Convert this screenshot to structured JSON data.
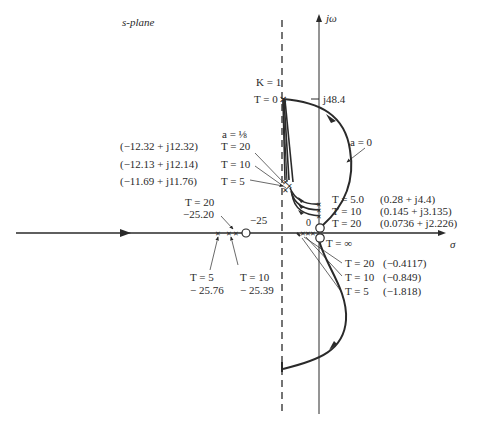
{
  "title": "s-plane",
  "axes": {
    "imag_label": "jω",
    "real_label": "σ",
    "imag_tick": "j48.4",
    "origin_label": "0",
    "zero_label": "−25"
  },
  "gain": {
    "k_label": "K = 1",
    "t0_label": "T = 0",
    "a_eighth_label": "a = ⅛",
    "a_zero_label": "a = 0",
    "t_inf_label": "T = ∞"
  },
  "upper_left_points": [
    {
      "t": "T = 20",
      "value": "(−12.32 + j12.32)"
    },
    {
      "t": "T = 10",
      "value": "(−12.13 + j12.14)"
    },
    {
      "t": "T = 5",
      "value": "(−11.69 + j11.76)"
    }
  ],
  "upper_right_points": [
    {
      "t": "T = 5.0",
      "value": "(0.28 + j4.4)"
    },
    {
      "t": "T = 10",
      "value": "(0.145 + j3.135)"
    },
    {
      "t": "T = 20",
      "value": "(0.0736 + j2.226)"
    }
  ],
  "real_axis_near_origin": [
    {
      "t": "T = 20",
      "value": "(−0.4117)"
    },
    {
      "t": "T = 10",
      "value": "(−0.849)"
    },
    {
      "t": "T = 5",
      "value": "(−1.818)"
    }
  ],
  "real_axis_far": [
    {
      "t": "T = 20",
      "value": "−25.20"
    },
    {
      "t": "T = 5",
      "value": "− 25.76"
    },
    {
      "t": "T = 10",
      "value": "− 25.39"
    }
  ],
  "colors": {
    "ink": "#2a2a2a",
    "background": "#ffffff"
  }
}
